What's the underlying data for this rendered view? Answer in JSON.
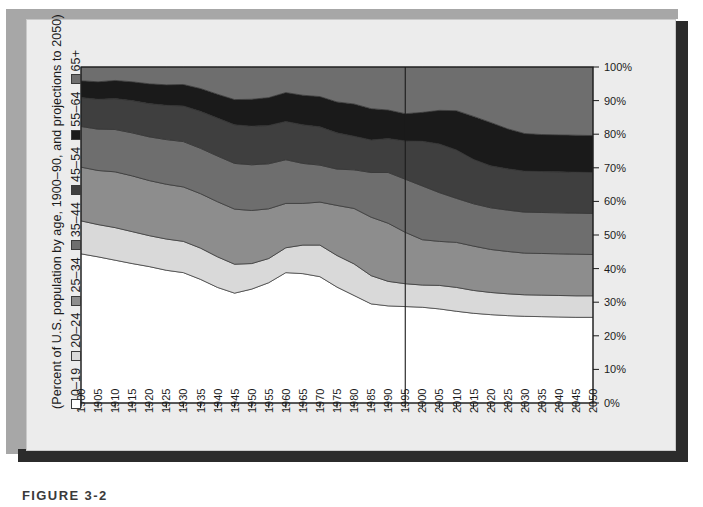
{
  "figure": {
    "caption": "FIGURE 3-2",
    "axis_caption": "(Percent of U.S. population by age, 1900–90, and projections to 2050)"
  },
  "legend": {
    "entries": [
      {
        "label": "0–19",
        "color": "#ffffff"
      },
      {
        "label": "20–24",
        "color": "#d9d9d9"
      },
      {
        "label": "25–34",
        "color": "#8d8d8d"
      },
      {
        "label": "35–44",
        "color": "#6e6e6e"
      },
      {
        "label": "45–54",
        "color": "#3f3f3f"
      },
      {
        "label": "55–64",
        "color": "#1a1a1a"
      },
      {
        "label": "65+",
        "color": "#6e6e6e"
      }
    ]
  },
  "chart_data": {
    "type": "area",
    "title": "",
    "subtitle": "",
    "xlabel": "",
    "ylabel": "",
    "ylim": [
      0,
      100
    ],
    "ytick_labels": [
      "0%",
      "10%",
      "20%",
      "30%",
      "40%",
      "50%",
      "60%",
      "70%",
      "80%",
      "90%",
      "100%"
    ],
    "ytick_values": [
      0,
      10,
      20,
      30,
      40,
      50,
      60,
      70,
      80,
      90,
      100
    ],
    "y_axis_position": "right",
    "grid": false,
    "legend_position": "left-vertical",
    "stacked": true,
    "stack_total": 100,
    "annotations": [
      {
        "type": "vertical-line",
        "x": 1995,
        "label": "projection boundary"
      }
    ],
    "categories": [
      1900,
      1905,
      1910,
      1915,
      1920,
      1925,
      1930,
      1935,
      1940,
      1945,
      1950,
      1955,
      1960,
      1965,
      1970,
      1975,
      1980,
      1985,
      1990,
      1995,
      2000,
      2005,
      2010,
      2015,
      2020,
      2025,
      2030,
      2035,
      2040,
      2045,
      2050
    ],
    "x": [
      1900,
      1905,
      1910,
      1915,
      1920,
      1925,
      1930,
      1935,
      1940,
      1945,
      1950,
      1955,
      1960,
      1965,
      1970,
      1975,
      1980,
      1985,
      1990,
      1995,
      2000,
      2005,
      2010,
      2015,
      2020,
      2025,
      2030,
      2035,
      2040,
      2045,
      2050
    ],
    "series": [
      {
        "name": "0–19",
        "color": "#ffffff",
        "values": [
          44.4,
          43.5,
          42.5,
          41.5,
          40.6,
          39.5,
          38.8,
          36.8,
          34.4,
          32.7,
          33.9,
          35.8,
          38.8,
          38.5,
          37.6,
          34.5,
          32.0,
          29.5,
          28.9,
          28.7,
          28.5,
          28.0,
          27.3,
          26.7,
          26.3,
          26.0,
          25.8,
          25.7,
          25.6,
          25.5,
          25.5
        ]
      },
      {
        "name": "20–24",
        "color": "#d9d9d9",
        "values": [
          9.8,
          9.6,
          9.7,
          9.5,
          9.2,
          9.3,
          9.3,
          9.3,
          9.1,
          8.6,
          7.6,
          7.2,
          7.4,
          8.5,
          9.4,
          9.4,
          9.4,
          8.4,
          7.3,
          6.8,
          6.6,
          7.0,
          7.1,
          6.8,
          6.6,
          6.5,
          6.4,
          6.4,
          6.4,
          6.4,
          6.4
        ]
      },
      {
        "name": "25–34",
        "color": "#8d8d8d",
        "values": [
          16.0,
          16.1,
          16.6,
          16.6,
          16.4,
          16.3,
          16.2,
          16.2,
          16.4,
          16.4,
          15.8,
          14.8,
          13.2,
          12.4,
          12.8,
          14.9,
          16.5,
          17.4,
          17.3,
          15.3,
          13.5,
          13.1,
          13.4,
          13.2,
          12.8,
          12.6,
          12.4,
          12.4,
          12.4,
          12.4,
          12.3
        ]
      },
      {
        "name": "35–44",
        "color": "#6e6e6e",
        "values": [
          12.1,
          12.3,
          12.6,
          12.8,
          13.0,
          13.3,
          13.5,
          13.5,
          13.6,
          13.6,
          13.6,
          13.4,
          13.0,
          11.9,
          11.0,
          10.8,
          11.5,
          13.3,
          15.1,
          15.8,
          16.0,
          14.5,
          13.1,
          12.6,
          12.4,
          12.3,
          12.2,
          12.2,
          12.2,
          12.2,
          12.2
        ]
      },
      {
        "name": "45–54",
        "color": "#3f3f3f",
        "values": [
          8.6,
          8.9,
          9.2,
          9.6,
          9.9,
          10.2,
          10.6,
          11.0,
          11.3,
          11.5,
          11.5,
          11.4,
          11.4,
          11.5,
          11.4,
          10.8,
          10.0,
          9.7,
          10.1,
          11.4,
          13.3,
          14.5,
          14.4,
          13.2,
          12.5,
          12.3,
          12.2,
          12.2,
          12.2,
          12.2,
          12.2
        ]
      },
      {
        "name": "55–64",
        "color": "#1a1a1a",
        "values": [
          5.0,
          5.2,
          5.4,
          5.6,
          5.9,
          6.1,
          6.4,
          6.8,
          7.1,
          7.5,
          8.0,
          8.3,
          8.6,
          8.8,
          9.0,
          9.2,
          9.6,
          9.3,
          8.5,
          8.1,
          8.6,
          10.0,
          11.7,
          12.8,
          12.9,
          11.9,
          11.2,
          11.0,
          11.0,
          11.0,
          11.0
        ]
      },
      {
        "name": "65+",
        "color": "#6e6e6e",
        "values": [
          4.1,
          4.4,
          4.0,
          4.4,
          5.0,
          5.3,
          5.2,
          6.4,
          8.1,
          9.7,
          9.6,
          9.1,
          7.6,
          8.4,
          8.8,
          10.4,
          11.0,
          12.4,
          12.8,
          13.9,
          13.5,
          12.9,
          13.0,
          14.7,
          16.5,
          18.4,
          19.8,
          20.1,
          20.2,
          20.3,
          20.4
        ]
      }
    ]
  }
}
